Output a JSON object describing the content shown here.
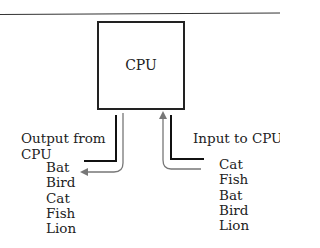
{
  "diagram": {
    "cpu_label": "CPU",
    "output_label_line1": "Output from",
    "output_label_line2": "CPU",
    "input_label": "Input to CPU",
    "output_items": [
      "Bat",
      "Bird",
      "Cat",
      "Fish",
      "Lion"
    ],
    "input_items": [
      "Cat",
      "Fish",
      "Bat",
      "Bird",
      "Lion"
    ]
  }
}
